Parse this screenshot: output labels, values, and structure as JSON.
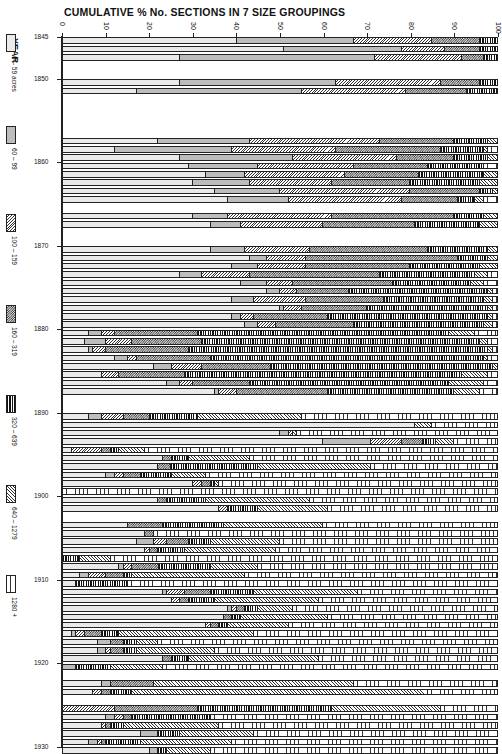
{
  "chart_data": {
    "type": "bar",
    "orientation": "horizontal",
    "stacked": "cumulative_percent",
    "title": "CUMULATIVE % No. SECTIONS IN 7 SIZE GROUPINGS",
    "xlabel": "CUMULATIVE %",
    "ylabel": "YEAR",
    "xlim": [
      0,
      100
    ],
    "x_ticks": [
      0,
      10,
      20,
      30,
      40,
      50,
      60,
      70,
      80,
      90,
      100
    ],
    "y_ticks": [
      1845,
      1850,
      1860,
      1870,
      1880,
      1890,
      1900,
      1910,
      1920,
      1930
    ],
    "ylim": [
      1845,
      1930
    ],
    "legend_position": "left",
    "legend": [
      {
        "label": "0 – 59 acres",
        "pattern": "dots"
      },
      {
        "label": "60 – 99",
        "pattern": "grey"
      },
      {
        "label": "100 – 159",
        "pattern": "diagonal"
      },
      {
        "label": "160 – 319",
        "pattern": "checker"
      },
      {
        "label": "320 – 639",
        "pattern": "vertical-dense"
      },
      {
        "label": "640 – 1279",
        "pattern": "diagonal-fine"
      },
      {
        "label": "1280 +",
        "pattern": "vertical-wide"
      }
    ],
    "series_names": [
      "0 – 59 acres",
      "60 – 99",
      "100 – 159",
      "160 – 319",
      "320 – 639",
      "640 – 1279",
      "1280 +"
    ],
    "rows_note": "Each row gives the cumulative % boundaries (upper edge of groups 1–7). Values estimated from pixel positions.",
    "rows": [
      {
        "year": 1845,
        "cum": [
          40,
          67,
          85,
          96,
          100,
          100,
          100
        ]
      },
      {
        "year": 1846,
        "cum": [
          51,
          78,
          88,
          96,
          100,
          100,
          100
        ]
      },
      {
        "year": 1847,
        "cum": [
          27,
          72,
          92,
          97,
          100,
          100,
          100
        ]
      },
      {
        "year": 1850,
        "cum": [
          27,
          63,
          87,
          96,
          100,
          100,
          100
        ]
      },
      {
        "year": 1851,
        "cum": [
          17,
          55,
          79,
          93,
          100,
          100,
          100
        ]
      },
      {
        "year": 1857,
        "cum": [
          22,
          43,
          73,
          90,
          98,
          100,
          100
        ]
      },
      {
        "year": 1858,
        "cum": [
          12,
          39,
          63,
          87,
          97,
          98,
          100
        ]
      },
      {
        "year": 1859,
        "cum": [
          27,
          53,
          77,
          90,
          98,
          100,
          100
        ]
      },
      {
        "year": 1860,
        "cum": [
          29,
          45,
          67,
          84,
          97,
          97,
          100
        ]
      },
      {
        "year": 1861,
        "cum": [
          33,
          42,
          65,
          82,
          97,
          100,
          100
        ]
      },
      {
        "year": 1862,
        "cum": [
          30,
          43,
          62,
          80,
          96,
          100,
          100
        ]
      },
      {
        "year": 1863,
        "cum": [
          35,
          50,
          80,
          96,
          99,
          100,
          100
        ]
      },
      {
        "year": 1864,
        "cum": [
          38,
          52,
          78,
          91,
          95,
          97,
          100
        ]
      },
      {
        "year": 1866,
        "cum": [
          30,
          38,
          62,
          90,
          97,
          100,
          100
        ]
      },
      {
        "year": 1867,
        "cum": [
          34,
          41,
          60,
          81,
          96,
          100,
          100
        ]
      },
      {
        "year": 1870,
        "cum": [
          34,
          42,
          57,
          84,
          98,
          100,
          100
        ]
      },
      {
        "year": 1871,
        "cum": [
          43,
          47,
          56,
          91,
          98,
          100,
          100
        ]
      },
      {
        "year": 1872,
        "cum": [
          39,
          45,
          56,
          80,
          96,
          100,
          100
        ]
      },
      {
        "year": 1873,
        "cum": [
          27,
          32,
          43,
          73,
          95,
          98,
          100
        ]
      },
      {
        "year": 1874,
        "cum": [
          41,
          47,
          53,
          76,
          94,
          97,
          100
        ]
      },
      {
        "year": 1875,
        "cum": [
          47,
          50,
          54,
          66,
          98,
          99,
          100
        ]
      },
      {
        "year": 1876,
        "cum": [
          39,
          44,
          56,
          74,
          97,
          99,
          100
        ]
      },
      {
        "year": 1877,
        "cum": [
          50,
          51,
          55,
          70,
          98,
          99,
          100
        ]
      },
      {
        "year": 1878,
        "cum": [
          39,
          41,
          44,
          61,
          98,
          99,
          100
        ]
      },
      {
        "year": 1879,
        "cum": [
          42,
          45,
          49,
          67,
          97,
          99,
          100
        ]
      },
      {
        "year": 1880,
        "cum": [
          6,
          9,
          12,
          31,
          89,
          95,
          100
        ]
      },
      {
        "year": 1881,
        "cum": [
          5,
          10,
          16,
          32,
          96,
          98,
          100
        ]
      },
      {
        "year": 1882,
        "cum": [
          6,
          7,
          10,
          29,
          98,
          99,
          100
        ]
      },
      {
        "year": 1883,
        "cum": [
          12,
          15,
          17,
          34,
          97,
          98,
          100
        ]
      },
      {
        "year": 1884,
        "cum": [
          21,
          25,
          32,
          48,
          99,
          100,
          100
        ]
      },
      {
        "year": 1885,
        "cum": [
          9,
          9,
          13,
          28,
          92,
          98,
          100
        ]
      },
      {
        "year": 1886,
        "cum": [
          24,
          27,
          30,
          43,
          89,
          97,
          100
        ]
      },
      {
        "year": 1887,
        "cum": [
          35,
          36,
          40,
          61,
          90,
          96,
          100
        ]
      },
      {
        "year": 1890,
        "cum": [
          6,
          9,
          14,
          20,
          31,
          55,
          100
        ]
      },
      {
        "year": 1891,
        "cum": [
          81,
          81,
          81,
          81,
          81,
          85,
          100
        ]
      },
      {
        "year": 1892,
        "cum": [
          50,
          52,
          53,
          53,
          53,
          54,
          100
        ]
      },
      {
        "year": 1893,
        "cum": [
          60,
          71,
          78,
          83,
          86,
          90,
          100
        ]
      },
      {
        "year": 1894,
        "cum": [
          2,
          2,
          9,
          11,
          13,
          19,
          100
        ]
      },
      {
        "year": 1895,
        "cum": [
          23,
          23,
          23,
          25,
          29,
          43,
          100
        ]
      },
      {
        "year": 1896,
        "cum": [
          22,
          22,
          22,
          25,
          45,
          71,
          100
        ]
      },
      {
        "year": 1897,
        "cum": [
          10,
          12,
          14,
          18,
          25,
          33,
          100
        ]
      },
      {
        "year": 1898,
        "cum": [
          30,
          30,
          32,
          34,
          35,
          36,
          100
        ]
      },
      {
        "year": 1899,
        "cum": [
          0,
          0,
          0,
          0,
          0,
          0,
          100
        ]
      },
      {
        "year": 1900,
        "cum": [
          22,
          22,
          22,
          24,
          33,
          57,
          100
        ]
      },
      {
        "year": 1901,
        "cum": [
          36,
          36,
          38,
          38,
          45,
          61,
          100
        ]
      },
      {
        "year": 1903,
        "cum": [
          15,
          15,
          15,
          23,
          37,
          60,
          100
        ]
      },
      {
        "year": 1904,
        "cum": [
          19,
          19,
          19,
          21,
          21,
          21,
          100
        ]
      },
      {
        "year": 1905,
        "cum": [
          17,
          21,
          24,
          29,
          34,
          50,
          100
        ]
      },
      {
        "year": 1906,
        "cum": [
          19,
          19,
          20,
          22,
          28,
          49,
          100
        ]
      },
      {
        "year": 1907,
        "cum": [
          0,
          0,
          0,
          0,
          4,
          11,
          100
        ]
      },
      {
        "year": 1908,
        "cum": [
          13,
          14,
          16,
          22,
          34,
          45,
          100
        ]
      },
      {
        "year": 1909,
        "cum": [
          4,
          6,
          10,
          14,
          16,
          42,
          100
        ]
      },
      {
        "year": 1910,
        "cum": [
          3,
          3,
          3,
          3,
          15,
          15,
          100
        ]
      },
      {
        "year": 1911,
        "cum": [
          23,
          24,
          28,
          34,
          44,
          68,
          100
        ]
      },
      {
        "year": 1912,
        "cum": [
          25,
          25,
          27,
          29,
          35,
          59,
          100
        ]
      },
      {
        "year": 1913,
        "cum": [
          38,
          39,
          40,
          42,
          45,
          53,
          100
        ]
      },
      {
        "year": 1914,
        "cum": [
          37,
          37,
          37,
          39,
          41,
          61,
          100
        ]
      },
      {
        "year": 1915,
        "cum": [
          33,
          33,
          34,
          36,
          38,
          52,
          100
        ]
      },
      {
        "year": 1916,
        "cum": [
          2,
          3,
          5,
          9,
          13,
          44,
          100
        ]
      },
      {
        "year": 1917,
        "cum": [
          8,
          11,
          11,
          14,
          17,
          22,
          100
        ]
      },
      {
        "year": 1918,
        "cum": [
          8,
          10,
          11,
          14,
          17,
          35,
          100
        ]
      },
      {
        "year": 1919,
        "cum": [
          23,
          23,
          23,
          25,
          29,
          59,
          100
        ]
      },
      {
        "year": 1920,
        "cum": [
          0,
          3,
          3,
          3,
          11,
          23,
          100
        ]
      },
      {
        "year": 1922,
        "cum": [
          9,
          11,
          11,
          21,
          21,
          67,
          100
        ]
      },
      {
        "year": 1923,
        "cum": [
          7,
          7,
          9,
          11,
          16,
          84,
          100
        ]
      },
      {
        "year": 1925,
        "cum": [
          0,
          0,
          12,
          31,
          62,
          87,
          100
        ]
      },
      {
        "year": 1926,
        "cum": [
          10,
          12,
          14,
          16,
          34,
          34,
          100
        ]
      },
      {
        "year": 1927,
        "cum": [
          9,
          9,
          10,
          11,
          14,
          36,
          100
        ]
      },
      {
        "year": 1928,
        "cum": [
          18,
          22,
          22,
          22,
          27,
          44,
          100
        ]
      },
      {
        "year": 1929,
        "cum": [
          6,
          8,
          9,
          10,
          18,
          39,
          100
        ]
      },
      {
        "year": 1930,
        "cum": [
          20,
          22,
          22,
          22,
          24,
          34,
          100
        ]
      }
    ]
  },
  "ui": {
    "title": "CUMULATIVE % No. SECTIONS IN 7 SIZE GROUPINGS",
    "year_label": "YEAR"
  }
}
